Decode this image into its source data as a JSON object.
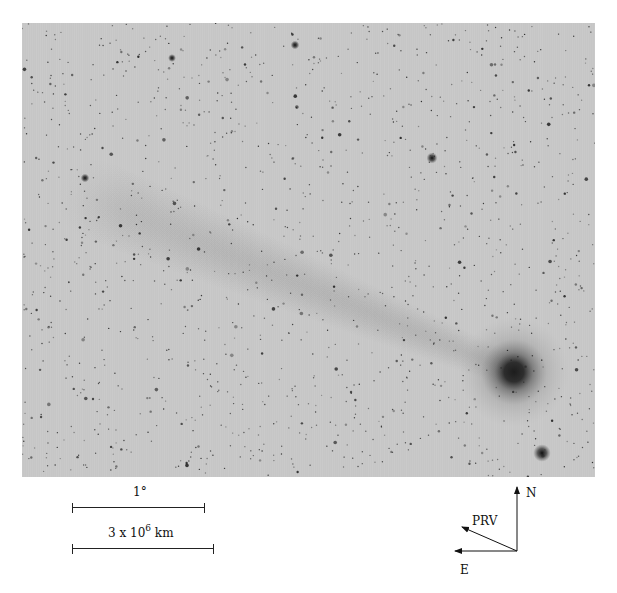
{
  "figure": {
    "background_color": "#c6c6c6",
    "comet_head_color": "#1a1a1a",
    "star_color": "#2a2a2a"
  },
  "scale_bars": [
    {
      "label": "1°"
    },
    {
      "label_prefix": "3 x 10",
      "label_exponent": "6",
      "label_suffix": " km"
    }
  ],
  "compass": {
    "north_label": "N",
    "east_label": "E",
    "prv_label": "PRV"
  }
}
